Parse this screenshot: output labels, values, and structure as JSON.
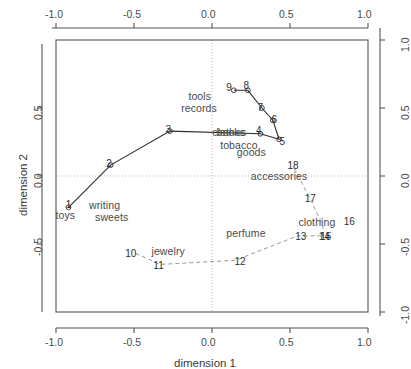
{
  "chart_data": {
    "type": "scatter",
    "title": "",
    "xlabel": "dimension 1",
    "ylabel": "dimension 2",
    "xlim": [
      -1.0,
      1.0
    ],
    "ylim": [
      -1.0,
      1.0
    ],
    "xticks": [
      "-1.0",
      "-0.5",
      "0.0",
      "0.5",
      "1.0"
    ],
    "xtickvals": [
      -1.0,
      -0.5,
      0.0,
      0.5,
      1.0
    ],
    "yticks": [
      "-1.0",
      "-0.5",
      "0.0",
      "0.5",
      "1.0"
    ],
    "ytickvals": [
      -1.0,
      -0.5,
      0.0,
      0.5,
      1.0
    ],
    "right_axis_ticks": [
      "1.0",
      "0.5",
      "0.0",
      "-0.5",
      "-1.0"
    ],
    "top_axis_ticks": [
      "-1.0",
      "-0.5",
      "0.0",
      "0.5",
      "1.0"
    ],
    "grid": "dotted reference lines at x=0 and y=0",
    "legend": "none",
    "axes_box": true,
    "series": [
      {
        "name": "solid-curve",
        "style": "solid",
        "marker": "open-circle",
        "points": [
          {
            "label": "1",
            "x": -0.92,
            "y": -0.23
          },
          {
            "label": "2",
            "x": -0.65,
            "y": 0.08
          },
          {
            "label": "3",
            "x": -0.27,
            "y": 0.33
          },
          {
            "label": "4",
            "x": 0.31,
            "y": 0.31
          },
          {
            "label": "5",
            "x": 0.43,
            "y": 0.27
          },
          {
            "label": "6",
            "x": 0.39,
            "y": 0.41
          },
          {
            "label": "7",
            "x": 0.32,
            "y": 0.5
          },
          {
            "label": "8",
            "x": 0.23,
            "y": 0.63
          },
          {
            "label": "9",
            "x": 0.14,
            "y": 0.63
          }
        ]
      },
      {
        "name": "dashed-curve",
        "style": "dashed",
        "marker": "none",
        "points": [
          {
            "label": "10",
            "x": -0.49,
            "y": -0.57
          },
          {
            "label": "11",
            "x": -0.33,
            "y": -0.65
          },
          {
            "label": "12",
            "x": 0.15,
            "y": -0.62
          },
          {
            "label": "13",
            "x": 0.55,
            "y": -0.44
          },
          {
            "label": "14",
            "x": 0.7,
            "y": -0.44
          },
          {
            "label": "15",
            "x": 0.71,
            "y": -0.45
          },
          {
            "label": "16",
            "x": 0.71,
            "y": -0.36
          },
          {
            "label": "17",
            "x": 0.63,
            "y": -0.17
          },
          {
            "label": "18",
            "x": 0.52,
            "y": 0.07
          }
        ]
      }
    ],
    "annotations": [
      {
        "text": "tools",
        "x": -0.06,
        "y": 0.59
      },
      {
        "text": "records",
        "x": -0.07,
        "y": 0.5
      },
      {
        "text": "books",
        "x": 0.12,
        "y": 0.32
      },
      {
        "text": "clothes",
        "x": 0.13,
        "y": 0.32
      },
      {
        "text": "tobacco",
        "x": 0.18,
        "y": 0.23
      },
      {
        "text": "goods",
        "x": 0.25,
        "y": 0.18
      },
      {
        "text": "18",
        "x": 0.52,
        "y": 0.07
      },
      {
        "text": "accessories",
        "x": 0.45,
        "y": 0.0
      },
      {
        "text": "17",
        "x": 0.63,
        "y": -0.17
      },
      {
        "text": "clothing",
        "x": 0.7,
        "y": -0.34
      },
      {
        "text": "16",
        "x": 0.88,
        "y": -0.34
      },
      {
        "text": "perfume",
        "x": 0.22,
        "y": -0.42
      },
      {
        "text": "13",
        "x": 0.57,
        "y": -0.45
      },
      {
        "text": "14",
        "x": 0.72,
        "y": -0.45
      },
      {
        "text": "15",
        "x": 0.73,
        "y": -0.45
      },
      {
        "text": "toys",
        "x": -0.93,
        "y": -0.29
      },
      {
        "text": "writing",
        "x": -0.66,
        "y": -0.21
      },
      {
        "text": "sweets",
        "x": -0.64,
        "y": -0.3
      },
      {
        "text": "10",
        "x": -0.52,
        "y": -0.57
      },
      {
        "text": "jewelry",
        "x": -0.26,
        "y": -0.55
      },
      {
        "text": "11",
        "x": -0.34,
        "y": -0.66
      },
      {
        "text": "12",
        "x": 0.18,
        "y": -0.63
      },
      {
        "text": "9",
        "x": 0.11,
        "y": 0.65
      },
      {
        "text": "8",
        "x": 0.22,
        "y": 0.66
      },
      {
        "text": "7",
        "x": 0.31,
        "y": 0.5
      },
      {
        "text": "6",
        "x": 0.4,
        "y": 0.41
      },
      {
        "text": "5",
        "x": 0.45,
        "y": 0.25
      },
      {
        "text": "4",
        "x": 0.3,
        "y": 0.33
      },
      {
        "text": "3",
        "x": -0.28,
        "y": 0.34
      },
      {
        "text": "2",
        "x": -0.66,
        "y": 0.09
      },
      {
        "text": "1",
        "x": -0.92,
        "y": -0.21
      }
    ],
    "colors": {
      "axis": "#555555",
      "curve_solid": "#2b2b2b",
      "curve_dashed": "#9a9a9a",
      "gridline": "#b5b5b5",
      "text": "#4a4a4a",
      "background": "#ffffff"
    }
  },
  "axis_titles": {
    "x": "dimension 1",
    "y": "dimension 2"
  },
  "tick_labels": {
    "bottom": [
      "-1.0",
      "-0.5",
      "0.0",
      "0.5",
      "1.0"
    ],
    "top": [
      "-1.0",
      "-0.5",
      "0.0",
      "0.5",
      "1.0"
    ],
    "left": [
      "0.5",
      "0.0",
      "-0.5"
    ],
    "right": [
      "1.0",
      "0.5",
      "0.0",
      "-0.5",
      "-1.0"
    ]
  }
}
